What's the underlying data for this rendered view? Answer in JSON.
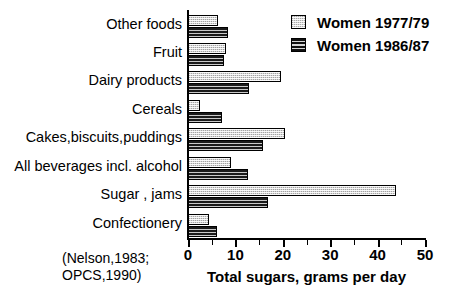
{
  "chart_data": {
    "type": "bar",
    "orientation": "horizontal",
    "title": "",
    "xlabel": "Total sugars, grams per day",
    "ylabel": "",
    "xlim": [
      0,
      50
    ],
    "xticks": [
      0,
      10,
      20,
      30,
      40,
      50
    ],
    "xticklabels": [
      "0",
      "10",
      "20",
      "30",
      "40",
      "50"
    ],
    "minor_ticks": [
      5,
      15,
      25,
      35,
      45
    ],
    "grid": false,
    "legend_position": "top-right",
    "categories": [
      "Other foods",
      "Fruit",
      "Dairy products",
      "Cereals",
      "Cakes,biscuits,puddings",
      "All beverages incl. alcohol",
      "Sugar , jams",
      "Confectionery"
    ],
    "series": [
      {
        "name": "Women 1977/79",
        "fill": "light-dotted",
        "values": [
          6.3,
          8.0,
          19.7,
          2.5,
          20.5,
          9.1,
          43.9,
          4.4
        ]
      },
      {
        "name": "Women 1986/87",
        "fill": "dark-hatched",
        "values": [
          8.4,
          7.7,
          12.8,
          7.2,
          15.8,
          12.7,
          16.9,
          6.1
        ]
      }
    ],
    "source_note_lines": [
      "(Nelson,1983;",
      "OPCS,1990)"
    ]
  },
  "legend": {
    "items": [
      {
        "label": "Women 1977/79",
        "swatch": "light-dotted-swatch"
      },
      {
        "label": "Women 1986/87",
        "swatch": "dark-hatched-swatch"
      }
    ]
  },
  "footer": {
    "source_line1": "(Nelson,1983;",
    "source_line2": "OPCS,1990)"
  }
}
